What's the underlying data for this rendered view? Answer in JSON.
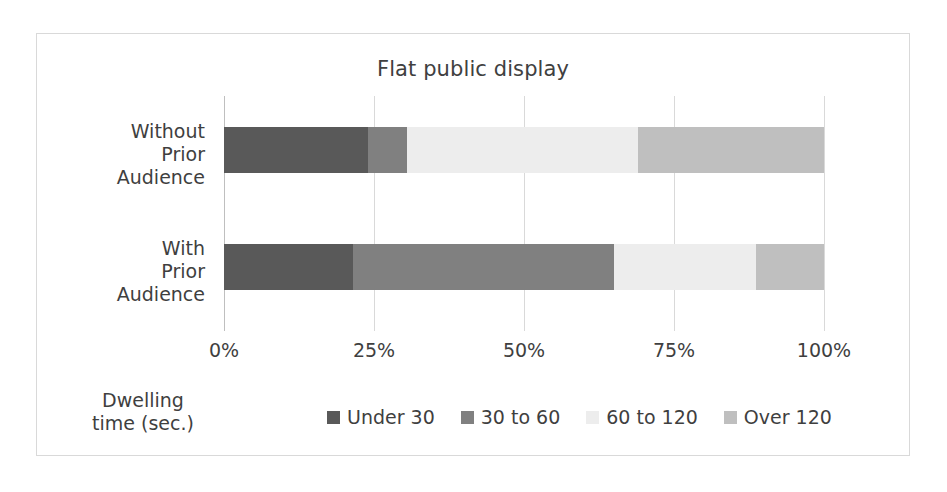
{
  "chart_data": {
    "type": "bar",
    "orientation": "horizontal",
    "stacked": true,
    "normalized": true,
    "title": "Flat public display",
    "xlabel": "",
    "ylabel": "",
    "legend_title": "Dwelling time (sec.)",
    "legend_position": "bottom",
    "grid": true,
    "xlim": [
      0,
      100
    ],
    "xticks": [
      0,
      25,
      50,
      75,
      100
    ],
    "xticklabels": [
      "0%",
      "25%",
      "50%",
      "75%",
      "100%"
    ],
    "categories": [
      "Without Prior Audience",
      "With Prior Audience"
    ],
    "category_lines": [
      [
        "Without",
        "Prior",
        "Audience"
      ],
      [
        "With",
        "Prior",
        "Audience"
      ]
    ],
    "series": [
      {
        "name": "Under 30",
        "color": "#595959",
        "values": [
          24.0,
          21.5
        ]
      },
      {
        "name": "30 to 60",
        "color": "#808080",
        "values": [
          6.5,
          43.5
        ]
      },
      {
        "name": "60 to 120",
        "color": "#ededed",
        "values": [
          38.5,
          23.7
        ]
      },
      {
        "name": "Over 120",
        "color": "#bfbfbf",
        "values": [
          31.0,
          11.3
        ]
      }
    ]
  },
  "colors": {
    "frame_border": "#d9d9d9",
    "gridline": "#d9d9d9",
    "text": "#3f3f3f",
    "background": "#ffffff"
  }
}
